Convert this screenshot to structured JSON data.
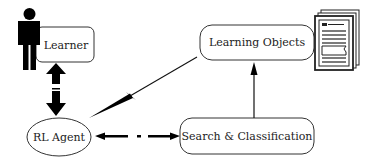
{
  "diagram": {
    "nodes": {
      "learner": {
        "label": "Learner"
      },
      "learning_objects": {
        "label": "Learning Objects"
      },
      "rl_agent": {
        "label": "RL Agent"
      },
      "search_classification": {
        "label": "Search & Classification"
      }
    },
    "icons": {
      "learner_figure": "person-icon",
      "documents": "document-stack-icon"
    },
    "edges": [
      {
        "from": "learner",
        "to": "rl_agent",
        "style": "thick-double-arrow"
      },
      {
        "from": "learning_objects",
        "to": "rl_agent",
        "style": "tapered-arrow"
      },
      {
        "from": "rl_agent",
        "to": "search_classification",
        "style": "dashed-double-arrow"
      },
      {
        "from": "search_classification",
        "to": "learning_objects",
        "style": "arrow"
      }
    ],
    "colors": {
      "stroke": "#222222",
      "fill": "#ffffff",
      "arrow": "#000000"
    }
  }
}
